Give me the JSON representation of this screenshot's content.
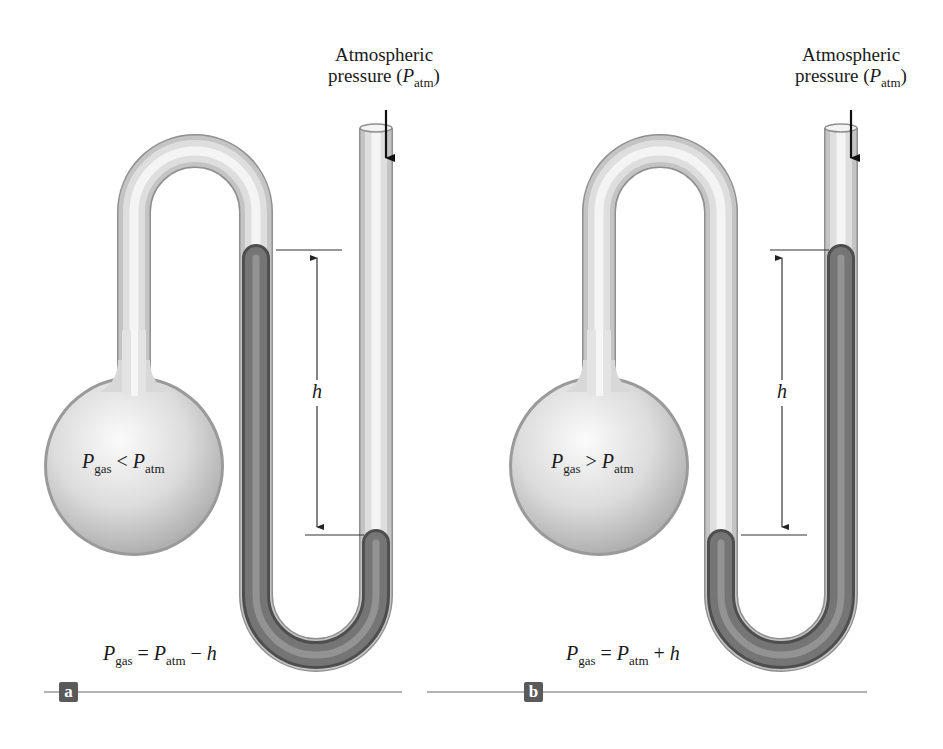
{
  "figure": {
    "panels": [
      {
        "id": "a",
        "badge": "a",
        "top_label_line1": "Atmospheric",
        "top_label_line2_prefix": "pressure (",
        "top_label_P": "P",
        "top_label_sub": "atm",
        "top_label_suffix": ")",
        "bulb_relation": {
          "lhs": "P",
          "lhs_sub": "gas",
          "op": "<",
          "rhs": "P",
          "rhs_sub": "atm"
        },
        "height_label": "h",
        "equation": {
          "lhs": "P",
          "lhs_sub": "gas",
          "eq": "=",
          "rhs": "P",
          "rhs_sub": "atm",
          "op": "−",
          "term": "h"
        },
        "liquid_higher_side": "gas side"
      },
      {
        "id": "b",
        "badge": "b",
        "top_label_line1": "Atmospheric",
        "top_label_line2_prefix": "pressure (",
        "top_label_P": "P",
        "top_label_sub": "atm",
        "top_label_suffix": ")",
        "bulb_relation": {
          "lhs": "P",
          "lhs_sub": "gas",
          "op": ">",
          "rhs": "P",
          "rhs_sub": "atm"
        },
        "height_label": "h",
        "equation": {
          "lhs": "P",
          "lhs_sub": "gas",
          "eq": "=",
          "rhs": "P",
          "rhs_sub": "atm",
          "op": "+",
          "term": "h"
        },
        "liquid_higher_side": "open side"
      }
    ],
    "colors": {
      "glass": "#d9d9d9",
      "glass_edge": "#9a9a9a",
      "liquid": "#6e6e6e",
      "liquid_edge": "#4a4a4a",
      "badge_bg": "#5a5a5a",
      "rule": "#9a9a9a",
      "text": "#1a1a1a"
    }
  }
}
